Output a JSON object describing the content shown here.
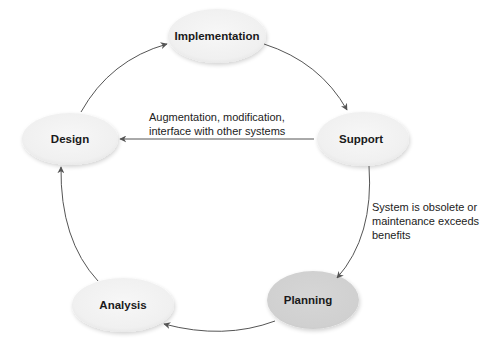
{
  "diagram": {
    "type": "cycle",
    "colors": {
      "node_fill": "#f2f2f2",
      "node_fill_highlight": "#d2d2d2",
      "arrow": "#555555",
      "text": "#1a1a1a"
    },
    "nodes": [
      {
        "id": "implementation",
        "label": "Implementation",
        "cx": 217,
        "cy": 36,
        "rx": 49,
        "ry": 27,
        "highlight": false
      },
      {
        "id": "support",
        "label": "Support",
        "cx": 363,
        "cy": 139,
        "rx": 46,
        "ry": 27,
        "highlight": false
      },
      {
        "id": "planning",
        "label": "Planning",
        "cx": 313,
        "cy": 300,
        "rx": 46,
        "ry": 29,
        "highlight": true
      },
      {
        "id": "analysis",
        "label": "Analysis",
        "cx": 123,
        "cy": 305,
        "rx": 51,
        "ry": 27,
        "highlight": false
      },
      {
        "id": "design",
        "label": "Design",
        "cx": 70,
        "cy": 139,
        "rx": 48,
        "ry": 26,
        "highlight": false
      }
    ],
    "edges": [
      {
        "from": "design",
        "to": "implementation",
        "label": ""
      },
      {
        "from": "implementation",
        "to": "support",
        "label": ""
      },
      {
        "from": "support",
        "to": "planning",
        "label_lines": [
          "System is obsolete or",
          "maintenance exceeds",
          "benefits"
        ]
      },
      {
        "from": "planning",
        "to": "analysis",
        "label": ""
      },
      {
        "from": "analysis",
        "to": "design",
        "label": ""
      },
      {
        "from": "support",
        "to": "design",
        "label_lines": [
          "Augmentation, modification,",
          "interface with other systems"
        ]
      }
    ]
  }
}
